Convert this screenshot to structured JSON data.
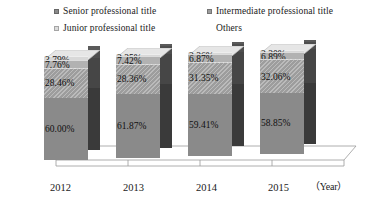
{
  "legend": {
    "position": "top",
    "items": [
      {
        "label": "Senior professional title",
        "color": "#8a8a8a",
        "key": "senior"
      },
      {
        "label": "Intermediate professional title",
        "color": "#9d9d9d",
        "key": "intermediate"
      },
      {
        "label": "Junior professional title",
        "color": "#b2b2b2",
        "key": "junior"
      },
      {
        "label": "Others",
        "color": "#d8d8d8",
        "key": "others"
      }
    ]
  },
  "axis": {
    "x_unit_label": "（Year）",
    "categories": [
      "2012",
      "2013",
      "2014",
      "2015"
    ]
  },
  "bars": [
    {
      "category": "2012",
      "segments": [
        {
          "key": "others",
          "label": "3.79%",
          "value": 3.79
        },
        {
          "key": "junior",
          "label": "7.76%",
          "value": 7.76
        },
        {
          "key": "intermediate",
          "label": "28.46%",
          "value": 28.46
        },
        {
          "key": "senior",
          "label": "60.00%",
          "value": 60.0
        }
      ]
    },
    {
      "category": "2013",
      "segments": [
        {
          "key": "others",
          "label": "2.35%",
          "value": 2.35
        },
        {
          "key": "junior",
          "label": "7.42%",
          "value": 7.42
        },
        {
          "key": "intermediate",
          "label": "28.36%",
          "value": 28.36
        },
        {
          "key": "senior",
          "label": "61.87%",
          "value": 61.87
        }
      ]
    },
    {
      "category": "2014",
      "segments": [
        {
          "key": "others",
          "label": "2.36%",
          "value": 2.36
        },
        {
          "key": "junior",
          "label": "6.87%",
          "value": 6.87
        },
        {
          "key": "intermediate",
          "label": "31.35%",
          "value": 31.35
        },
        {
          "key": "senior",
          "label": "59.41%",
          "value": 59.41
        }
      ]
    },
    {
      "category": "2015",
      "segments": [
        {
          "key": "others",
          "label": "2.20%",
          "value": 2.2
        },
        {
          "key": "junior",
          "label": "6.89%",
          "value": 6.89
        },
        {
          "key": "intermediate",
          "label": "32.06%",
          "value": 32.06
        },
        {
          "key": "senior",
          "label": "58.85%",
          "value": 58.85
        }
      ]
    }
  ],
  "chart_data": {
    "type": "bar",
    "subtype": "100% stacked column, 3-D",
    "title": "",
    "xlabel": "（Year）",
    "ylabel": "",
    "ylim": [
      0,
      100
    ],
    "grid": false,
    "legend_position": "top",
    "categories": [
      "2012",
      "2013",
      "2014",
      "2015"
    ],
    "series": [
      {
        "name": "Senior professional title",
        "values": [
          60.0,
          61.87,
          59.41,
          58.85
        ],
        "color": "#8a8a8a"
      },
      {
        "name": "Intermediate professional title",
        "values": [
          28.46,
          28.36,
          31.35,
          32.06
        ],
        "color": "#9d9d9d"
      },
      {
        "name": "Junior professional title",
        "values": [
          7.76,
          7.42,
          6.87,
          6.89
        ],
        "color": "#b2b2b2"
      },
      {
        "name": "Others",
        "values": [
          3.79,
          2.35,
          2.36,
          2.2
        ],
        "color": "#d8d8d8"
      }
    ],
    "data_labels": [
      [
        "60.00%",
        "28.46%",
        "7.76%",
        "3.79%"
      ],
      [
        "61.87%",
        "28.36%",
        "7.42%",
        "2.35%"
      ],
      [
        "59.41%",
        "31.35%",
        "6.87%",
        "2.36%"
      ],
      [
        "58.85%",
        "32.06%",
        "6.89%",
        "2.20%"
      ]
    ]
  }
}
